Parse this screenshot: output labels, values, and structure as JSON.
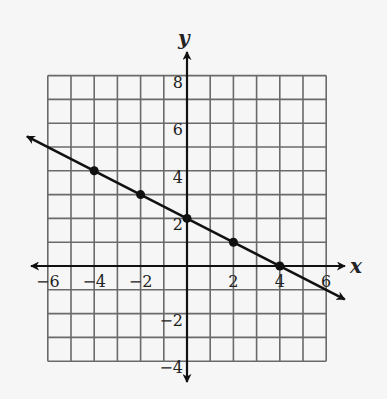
{
  "chart_data": {
    "type": "line",
    "title": "",
    "xlabel": "x",
    "ylabel": "y",
    "xlim": [
      -6,
      6
    ],
    "ylim": [
      -4,
      8
    ],
    "grid": true,
    "grid_step": 1,
    "x_ticks": [
      -6,
      -4,
      -2,
      2,
      4,
      6
    ],
    "y_ticks": [
      8,
      6,
      4,
      2,
      -2,
      -4
    ],
    "x_tick_labels": [
      "−6",
      "−4",
      "−2",
      "2",
      "4",
      "6"
    ],
    "y_tick_labels": [
      "8",
      "6",
      "4",
      "2",
      "−2",
      "−4"
    ],
    "series": [
      {
        "name": "line",
        "equation": "y = -1/2 x + 2",
        "x": [
          -4,
          -2,
          0,
          2,
          4
        ],
        "y": [
          4,
          3,
          2,
          1,
          0
        ],
        "arrows": "both ends",
        "extends_to": [
          [
            -6.9,
            5.45
          ],
          [
            6.8,
            -1.4
          ]
        ]
      }
    ],
    "colors": {
      "background": "#f6f6f6",
      "grid": "#6a6a6a",
      "axis": "#111111",
      "line": "#111111"
    }
  }
}
